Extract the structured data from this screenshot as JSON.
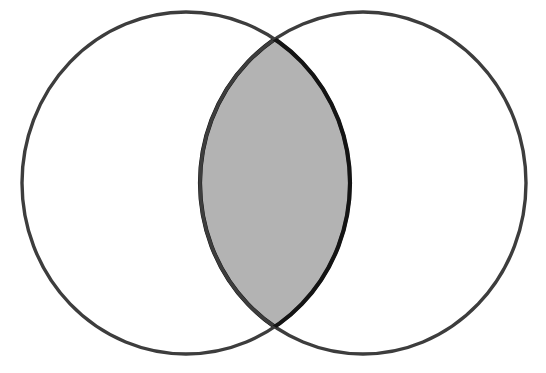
{
  "figure": {
    "type": "venn-diagram",
    "canvas": {
      "width": 546,
      "height": 373,
      "background": "#ffffff"
    },
    "colors": {
      "outline": "#3d3d3d",
      "lens_outline": "#141414",
      "lens_fill": "#b3b3b3",
      "circle_fill": "#ffffff",
      "background": "#ffffff"
    },
    "sets": [
      {
        "id": "left-set",
        "name": "left-circle",
        "label": "",
        "center_x": 186,
        "center_y": 183,
        "radius_x": 164,
        "radius_y": 171,
        "fill": "#ffffff",
        "stroke": "#3d3d3d",
        "stroke_width": 3.4
      },
      {
        "id": "right-set",
        "name": "right-circle",
        "label": "",
        "center_x": 363,
        "center_y": 183,
        "radius_x": 163,
        "radius_y": 171,
        "fill": "#ffffff",
        "stroke": "#3d3d3d",
        "stroke_width": 3.4
      }
    ],
    "intersection": {
      "id": "intersection-region",
      "name": "lens",
      "label": "",
      "shaded": true,
      "fill": "#b3b3b3",
      "stroke": "#141414",
      "stroke_width": 4.2,
      "top_point_x": 278,
      "top_point_y": 43,
      "bottom_point_x": 278,
      "bottom_point_y": 325,
      "left_extent_x": 202,
      "right_extent_x": 350
    }
  }
}
